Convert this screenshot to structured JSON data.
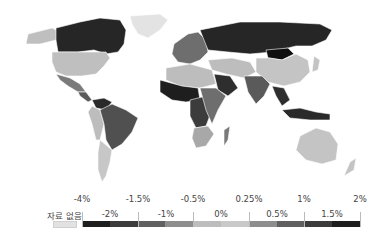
{
  "legend": {
    "no_data_label": "자료 없음",
    "no_data_color": "#e2e2e2",
    "top_ticks": [
      {
        "label": "-4%",
        "x": 82
      },
      {
        "label": "-1.5%",
        "x": 138
      },
      {
        "label": "-0.5%",
        "x": 193
      },
      {
        "label": "0.25%",
        "x": 249
      },
      {
        "label": "1%",
        "x": 304
      },
      {
        "label": "2%",
        "x": 360
      }
    ],
    "mid_ticks": [
      {
        "label": "-2%",
        "x": 110
      },
      {
        "label": "-1%",
        "x": 166
      },
      {
        "label": "0%",
        "x": 221
      },
      {
        "label": "0.5%",
        "x": 277
      },
      {
        "label": "1.5%",
        "x": 332
      }
    ],
    "segments": [
      "#1e1e1e",
      "#3c3c3c",
      "#606060",
      "#8e8e8e",
      "#bdbdbd",
      "#c9c9c9",
      "#8e8e8e",
      "#606060",
      "#3c3c3c",
      "#1e1e1e"
    ]
  },
  "map": {
    "ocean_color": "#ffffff",
    "regions": {
      "canada": "#262626",
      "usa": "#bfbfbf",
      "greenland": "#e3e3e3",
      "alaska": "#bfbfbf",
      "mexico": "#7a7a7a",
      "central_america": "#5a5a5a",
      "south_america_north": "#2a2a2a",
      "brazil": "#505050",
      "andes": "#bdbdbd",
      "argentina": "#c7c7c7",
      "europe": "#6e6e6e",
      "russia": "#262626",
      "mongolia": "#0f0f0f",
      "china": "#c4c4c4",
      "india": "#5a5a5a",
      "middle_east": "#bdbdbd",
      "arabia": "#2e2e2e",
      "north_africa": "#bdbdbd",
      "west_africa": "#1e1e1e",
      "central_africa": "#3c3c3c",
      "east_africa": "#6e6e6e",
      "south_africa": "#a8a8a8",
      "madagascar": "#7a7a7a",
      "southeast_asia": "#2e2e2e",
      "indonesia": "#2a2a2a",
      "australia": "#c4c4c4",
      "new_zealand": "#c4c4c4",
      "japan": "#c4c4c4"
    }
  }
}
